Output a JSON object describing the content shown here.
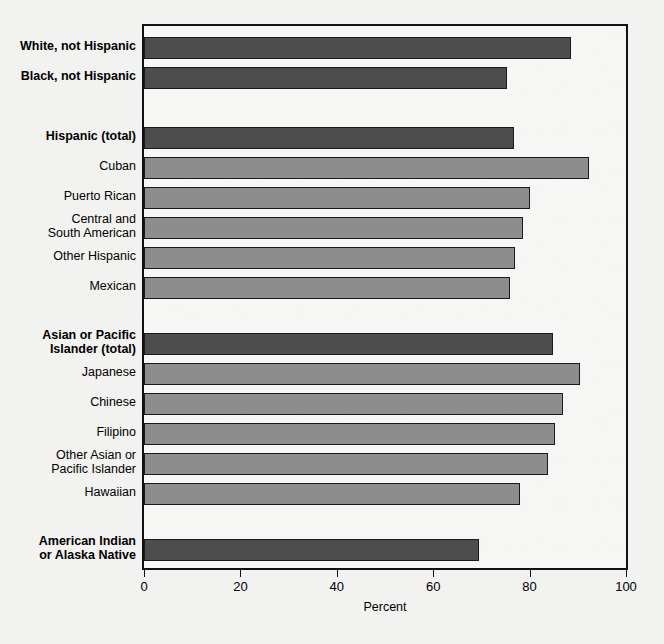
{
  "chart_data": {
    "type": "bar",
    "orientation": "horizontal",
    "title": "",
    "subtitle": "",
    "xlabel": "Percent",
    "ylabel": "",
    "xlim": [
      0,
      100
    ],
    "xticks": [
      0,
      20,
      40,
      60,
      80,
      100
    ],
    "xtick_labels": [
      "0",
      "20",
      "40",
      "60",
      "80",
      "100"
    ],
    "grid": false,
    "legend": false,
    "colors": {
      "total_bar": "#4d4d4d",
      "detail_bar": "#8d8d8d",
      "frame": "#111111",
      "background": "#f2f2f0"
    },
    "categories": [
      "White, not Hispanic",
      "Black, not Hispanic",
      "Hispanic (total)",
      "Cuban",
      "Puerto Rican",
      "Central and\nSouth American",
      "Other Hispanic",
      "Mexican",
      "Asian or Pacific\nIslander (total)",
      "Japanese",
      "Chinese",
      "Filipino",
      "Other Asian or\nPacific Islander",
      "Hawaiian",
      "American Indian\nor Alaska Native"
    ],
    "values": [
      88.6,
      75.3,
      76.8,
      92.4,
      80.0,
      78.6,
      77.0,
      76.0,
      84.8,
      90.4,
      87.0,
      85.2,
      83.8,
      78.0,
      69.6
    ],
    "bars": [
      {
        "label": "White, not Hispanic",
        "value": 88.6,
        "style": "total",
        "bold": true,
        "top": 11
      },
      {
        "label": "Black, not Hispanic",
        "value": 75.3,
        "style": "total",
        "bold": true,
        "top": 41
      },
      {
        "label": "Hispanic (total)",
        "value": 76.8,
        "style": "total",
        "bold": true,
        "top": 101
      },
      {
        "label": "Cuban",
        "value": 92.4,
        "style": "detail",
        "bold": false,
        "top": 131
      },
      {
        "label": "Puerto Rican",
        "value": 80.0,
        "style": "detail",
        "bold": false,
        "top": 161
      },
      {
        "label": "Central and\nSouth American",
        "value": 78.6,
        "style": "detail",
        "bold": false,
        "top": 191
      },
      {
        "label": "Other Hispanic",
        "value": 77.0,
        "style": "detail",
        "bold": false,
        "top": 221
      },
      {
        "label": "Mexican",
        "value": 76.0,
        "style": "detail",
        "bold": false,
        "top": 251
      },
      {
        "label": "Asian or Pacific\nIslander (total)",
        "value": 84.8,
        "style": "total",
        "bold": true,
        "top": 307
      },
      {
        "label": "Japanese",
        "value": 90.4,
        "style": "detail",
        "bold": false,
        "top": 337
      },
      {
        "label": "Chinese",
        "value": 87.0,
        "style": "detail",
        "bold": false,
        "top": 367
      },
      {
        "label": "Filipino",
        "value": 85.2,
        "style": "detail",
        "bold": false,
        "top": 397
      },
      {
        "label": "Other Asian or\nPacific Islander",
        "value": 83.8,
        "style": "detail",
        "bold": false,
        "top": 427
      },
      {
        "label": "Hawaiian",
        "value": 78.0,
        "style": "detail",
        "bold": false,
        "top": 457
      },
      {
        "label": "American Indian\nor Alaska Native",
        "value": 69.6,
        "style": "total",
        "bold": true,
        "top": 513
      }
    ]
  }
}
